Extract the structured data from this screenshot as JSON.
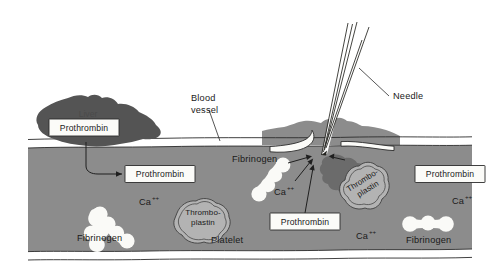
{
  "figure": {
    "background_color": "#ffffff"
  },
  "colors": {
    "blood_plasma": "#8c8c8c",
    "tissue": "#8c8c8c",
    "liver": "#545454",
    "clot": "#6b6b6b",
    "platelet_fill": "#b3b3b3",
    "cell_white": "#fafaf7",
    "outline": "#2b2b2b",
    "text": "#1a1a1a",
    "box_fill": "#fbfbf8"
  },
  "labels": {
    "liver": "Liver",
    "blood_vessel_line1": "Blood",
    "blood_vessel_line2": "vessel",
    "needle": "Needle",
    "platelet": "Platelet",
    "thromboplastin_line1": "Thrombo-",
    "thromboplastin_line2": "plastin",
    "calcium_ion": "Ca",
    "calcium_charge": "++"
  },
  "boxed_labels": [
    {
      "id": "prothrombin-liver",
      "text": "Prothrombin"
    },
    {
      "id": "prothrombin-vessel-left",
      "text": "Prothrombin"
    },
    {
      "id": "prothrombin-wound",
      "text": "Prothrombin"
    },
    {
      "id": "prothrombin-right",
      "text": "Prothrombin"
    }
  ],
  "fibrinogen_labels": [
    {
      "id": "fibrinogen-left",
      "text": "Fibrinogen"
    },
    {
      "id": "fibrinogen-middle",
      "text": "Fibrinogen"
    },
    {
      "id": "fibrinogen-right",
      "text": "Fibrinogen"
    }
  ],
  "calcium_labels": [
    {
      "id": "calcium-left",
      "text": "Ca",
      "charge": "++"
    },
    {
      "id": "calcium-middle",
      "text": "Ca",
      "charge": "++"
    },
    {
      "id": "calcium-lower-middle",
      "text": "Ca",
      "charge": "++"
    },
    {
      "id": "calcium-right",
      "text": "Ca",
      "charge": "++"
    }
  ],
  "thromboplastin_labels": [
    {
      "id": "thromboplastin-platelet-left",
      "line1": "Thrombo-",
      "line2": "plastin"
    },
    {
      "id": "thromboplastin-platelet-wound",
      "line1": "Thrombo-",
      "line2": "plastin"
    }
  ]
}
